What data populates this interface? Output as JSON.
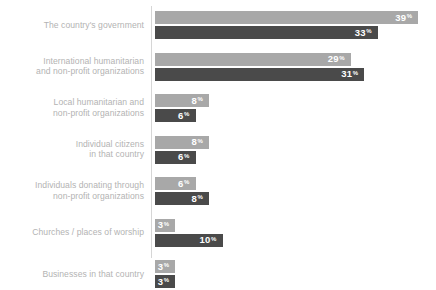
{
  "chart_data": {
    "type": "bar",
    "title": "",
    "subtitle": "",
    "xlabel": "",
    "ylabel": "",
    "orientation": "horizontal",
    "grouped": true,
    "grid": false,
    "legend_position": "none",
    "value_suffix": "%",
    "xlim": [
      0,
      42
    ],
    "categories": [
      "The country's government",
      "International humanitarian\nand non-profit organizations",
      "Local humanitarian and\nnon-profit organizations",
      "Individual citizens\nin that country",
      "Individuals donating through\nnon-profit organizations",
      "Churches / places of worship",
      "Businesses in that country"
    ],
    "series": [
      {
        "name": "series-light",
        "color": "#a8a8a8",
        "values": [
          39,
          29,
          8,
          8,
          6,
          3,
          3
        ]
      },
      {
        "name": "series-dark",
        "color": "#4a4a4a",
        "values": [
          33,
          31,
          6,
          6,
          8,
          10,
          3
        ]
      }
    ],
    "colors": {
      "light_bar": "#a8a8a8",
      "dark_bar": "#4a4a4a",
      "axis_line": "#d6d6d6",
      "label_text": "#b3b3b3",
      "value_text": "#ffffff",
      "background": "#ffffff"
    }
  }
}
